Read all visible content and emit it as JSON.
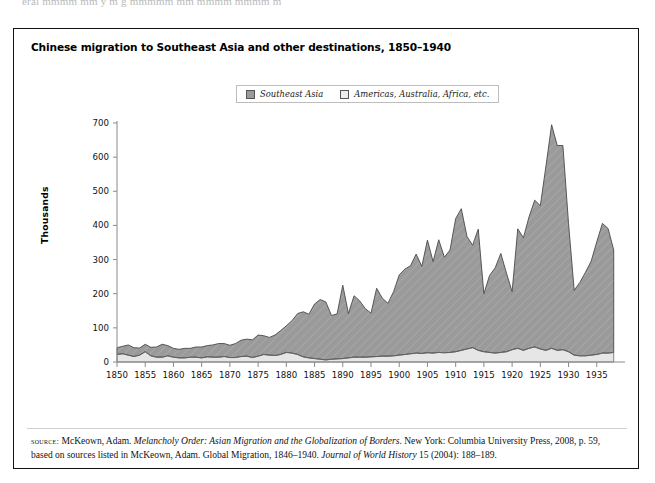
{
  "page_tail_text": "eral mmmm mm y m g mmmmm mm mmmm mmmm m",
  "figure": {
    "title": "Chinese migration to Southeast Asia and other destinations, 1850–1940",
    "legend": [
      {
        "label": "Southeast Asia",
        "color": "#9a9a9a",
        "name": "southeast-asia"
      },
      {
        "label": "Americas, Australia, Africa, etc.",
        "color": "#e6e6e6",
        "name": "americas-australia-africa"
      }
    ],
    "source": {
      "kicker": "source:",
      "line1_plain_a": " McKeown, Adam. ",
      "line1_italic_a": "Melancholy Order: Asian Migration and the Globalization of Borders",
      "line1_plain_b": ". New York: Columbia University Press, 2008,",
      "line2_plain_a": "p. 59, based on sources listed in McKeown, Adam. Global Migration, 1846–1940. ",
      "line2_italic_a": "Journal of World History",
      "line2_plain_b": " 15 (2004): 188–189."
    }
  },
  "chart_data": {
    "type": "area",
    "stacked": true,
    "title": "Chinese migration to Southeast Asia and other destinations, 1850–1940",
    "xlabel": "",
    "ylabel": "Thousands",
    "ylim": [
      0,
      700
    ],
    "ytick_step": 100,
    "yticks": [
      0,
      100,
      200,
      300,
      400,
      500,
      600,
      700
    ],
    "xlim": [
      1850,
      1940
    ],
    "xticks": [
      1850,
      1855,
      1860,
      1865,
      1870,
      1875,
      1880,
      1885,
      1890,
      1895,
      1900,
      1905,
      1910,
      1915,
      1920,
      1925,
      1930,
      1935
    ],
    "grid": false,
    "legend_position": "top-center",
    "x": [
      1850,
      1851,
      1852,
      1853,
      1854,
      1855,
      1856,
      1857,
      1858,
      1859,
      1860,
      1861,
      1862,
      1863,
      1864,
      1865,
      1866,
      1867,
      1868,
      1869,
      1870,
      1871,
      1872,
      1873,
      1874,
      1875,
      1876,
      1877,
      1878,
      1879,
      1880,
      1881,
      1882,
      1883,
      1884,
      1885,
      1886,
      1887,
      1888,
      1889,
      1890,
      1891,
      1892,
      1893,
      1894,
      1895,
      1896,
      1897,
      1898,
      1899,
      1900,
      1901,
      1902,
      1903,
      1904,
      1905,
      1906,
      1907,
      1908,
      1909,
      1910,
      1911,
      1912,
      1913,
      1914,
      1915,
      1916,
      1917,
      1918,
      1919,
      1920,
      1921,
      1922,
      1923,
      1924,
      1925,
      1926,
      1927,
      1928,
      1929,
      1930,
      1931,
      1932,
      1933,
      1934,
      1935,
      1936,
      1937,
      1938
    ],
    "series": [
      {
        "name": "Southeast Asia",
        "color": "#9a9a9a",
        "values": [
          20,
          22,
          30,
          26,
          21,
          22,
          25,
          30,
          38,
          30,
          26,
          25,
          28,
          26,
          30,
          32,
          33,
          36,
          40,
          38,
          36,
          41,
          48,
          50,
          52,
          62,
          55,
          52,
          60,
          70,
          78,
          95,
          120,
          132,
          128,
          160,
          175,
          170,
          128,
          132,
          215,
          130,
          180,
          165,
          142,
          128,
          200,
          170,
          155,
          188,
          235,
          250,
          258,
          290,
          255,
          330,
          268,
          330,
          280,
          300,
          390,
          415,
          330,
          300,
          355,
          170,
          225,
          250,
          290,
          230,
          170,
          350,
          330,
          385,
          430,
          420,
          540,
          655,
          600,
          598,
          375,
          190,
          215,
          245,
          275,
          330,
          380,
          365,
          300
        ]
      },
      {
        "name": "Americas, Australia, Africa, etc.",
        "color": "#e6e6e6",
        "values": [
          22,
          24,
          20,
          16,
          20,
          30,
          18,
          14,
          14,
          18,
          14,
          12,
          12,
          14,
          14,
          12,
          15,
          14,
          14,
          16,
          13,
          13,
          16,
          17,
          13,
          17,
          22,
          20,
          19,
          22,
          28,
          26,
          22,
          15,
          12,
          10,
          8,
          6,
          8,
          9,
          10,
          12,
          14,
          14,
          14,
          15,
          16,
          17,
          17,
          18,
          20,
          22,
          24,
          26,
          25,
          27,
          26,
          28,
          27,
          28,
          30,
          34,
          38,
          42,
          34,
          30,
          28,
          26,
          28,
          30,
          36,
          40,
          34,
          40,
          44,
          38,
          34,
          40,
          34,
          36,
          30,
          20,
          18,
          18,
          20,
          22,
          26,
          26,
          28
        ]
      }
    ],
    "notable_points": [
      {
        "year": 1927,
        "series": "Southeast Asia",
        "value": 655,
        "note": "peak"
      },
      {
        "year": 1911,
        "series": "Southeast Asia",
        "value": 415
      },
      {
        "year": 1931,
        "series": "Southeast Asia",
        "value": 190,
        "note": "depression trough"
      }
    ]
  }
}
